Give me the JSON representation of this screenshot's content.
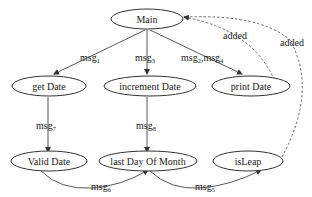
{
  "diagram": {
    "nodes": [
      {
        "id": "main",
        "label": "Main"
      },
      {
        "id": "getDate",
        "label": "get Date"
      },
      {
        "id": "incrementDate",
        "label": "increment Date"
      },
      {
        "id": "printDate",
        "label": "print Date"
      },
      {
        "id": "validDate",
        "label": "Valid Date"
      },
      {
        "id": "lastDayOfMonth",
        "label": "last Day Of Month"
      },
      {
        "id": "isLeap",
        "label": "isLeap"
      }
    ],
    "edges": [
      {
        "from": "main",
        "to": "getDate",
        "label": "msg",
        "sub": "1"
      },
      {
        "from": "main",
        "to": "incrementDate",
        "label": "msg",
        "sub": "3"
      },
      {
        "from": "main",
        "to": "printDate",
        "label": "msg",
        "sub": "2",
        "label2": ",msg",
        "sub2": "4"
      },
      {
        "from": "getDate",
        "to": "validDate",
        "label": "msg",
        "sub": "7"
      },
      {
        "from": "incrementDate",
        "to": "lastDayOfMonth",
        "label": "msg",
        "sub": "8"
      },
      {
        "from": "validDate",
        "to": "lastDayOfMonth",
        "label": "msg",
        "sub": "6"
      },
      {
        "from": "lastDayOfMonth",
        "to": "isLeap",
        "label": "msg",
        "sub": "5"
      },
      {
        "from": "printDate",
        "to": "main",
        "label": "added",
        "style": "dashed"
      },
      {
        "from": "isLeap",
        "to": "main",
        "label": "added",
        "style": "dashed"
      }
    ]
  }
}
